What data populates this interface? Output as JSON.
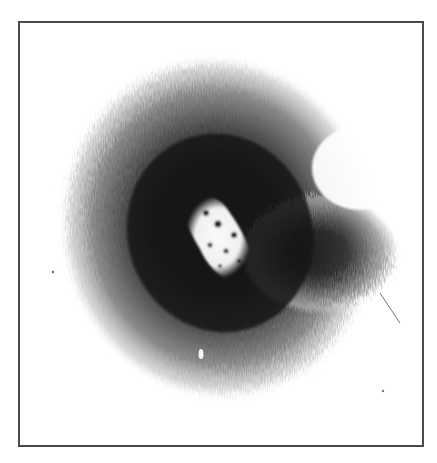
{
  "image": {
    "subject": "radial dark spreading pattern with bright irregular core",
    "palette": {
      "background": "#ffffff",
      "border": "#4a4a4a",
      "outer_halo": "#9a9a9a",
      "mid_ring": "#2a2a2a",
      "core": "#f4f4f4"
    },
    "frame": {
      "x": 18,
      "y": 21,
      "width": 404,
      "height": 424
    },
    "core_center": {
      "x": 212,
      "y": 228
    },
    "halo_center": {
      "x": 222,
      "y": 228
    }
  }
}
